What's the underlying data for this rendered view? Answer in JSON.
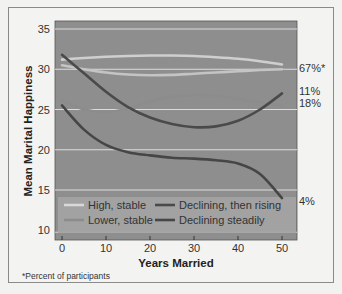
{
  "chart_data": {
    "type": "line",
    "title": "",
    "xlabel": "Years Married",
    "ylabel": "Mean Marital Happiness",
    "xlim": [
      0,
      50
    ],
    "ylim": [
      10,
      35
    ],
    "x_ticks": [
      "0",
      "10",
      "20",
      "30",
      "40",
      "50"
    ],
    "y_ticks": [
      "10",
      "15",
      "20",
      "25",
      "30",
      "35"
    ],
    "grid": "horizontal",
    "legend_position": "bottom-inside",
    "x": [
      0,
      5,
      10,
      15,
      20,
      25,
      30,
      35,
      40,
      45,
      50
    ],
    "series": [
      {
        "name": "High, stable",
        "color": "#cfcfcf",
        "end_label": "67%*",
        "values": [
          31.2,
          31.4,
          31.55,
          31.65,
          31.7,
          31.7,
          31.65,
          31.5,
          31.3,
          31.0,
          30.6
        ]
      },
      {
        "name": "High, stable (second)",
        "color": "#c4c4c4",
        "end_label": "",
        "values": [
          30.5,
          30.0,
          29.6,
          29.35,
          29.25,
          29.3,
          29.45,
          29.6,
          29.75,
          29.9,
          30.0
        ]
      },
      {
        "name": "Lower, stable",
        "color": "#8c8c8c",
        "end_label": "18%",
        "values": [
          26.1,
          25.0,
          24.7,
          25.1,
          26.0,
          26.6,
          26.8,
          26.7,
          26.3,
          25.9,
          25.5
        ]
      },
      {
        "name": "Declining, then rising",
        "color": "#4a4a4a",
        "end_label": "11%",
        "values": [
          31.8,
          29.5,
          27.2,
          25.3,
          24.0,
          23.2,
          22.8,
          22.9,
          23.6,
          25.0,
          27.0
        ]
      },
      {
        "name": "Declining steadily",
        "color": "#464646",
        "end_label": "4%",
        "values": [
          25.5,
          22.5,
          20.6,
          19.7,
          19.3,
          19.0,
          18.9,
          18.7,
          18.3,
          17.0,
          14.0
        ]
      }
    ],
    "footnote": "*Percent of participants"
  },
  "legend": {
    "items": [
      {
        "label": "High, stable",
        "color": "#d8d8d8"
      },
      {
        "label": "Lower, stable",
        "color": "#8c8c8c"
      },
      {
        "label": "Declining, then rising",
        "color": "#4a4a4a"
      },
      {
        "label": "Declining steadily",
        "color": "#464646"
      }
    ]
  },
  "labels": {
    "y_axis": "Mean Marital Happiness",
    "x_axis": "Years Married",
    "end_high": "67%*",
    "end_rising": "11%",
    "end_lower": "18%",
    "end_declining": "4%",
    "footnote": "*Percent of participants"
  },
  "colors": {
    "plot_bg": "#8e8e8e",
    "gridline": "#dcdcdc",
    "frame_bg": "#f3f3f1"
  }
}
